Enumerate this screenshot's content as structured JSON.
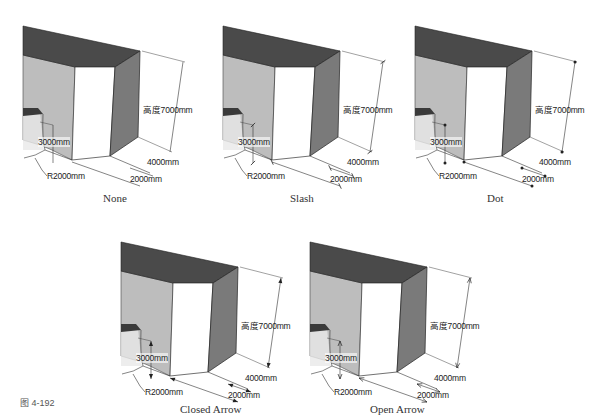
{
  "figure": {
    "label": "图 4-192"
  },
  "dimensions": {
    "height": "高度7000mm",
    "depth": "4000mm",
    "width": "2000mm",
    "opening": "3000mm",
    "radius": "R2000mm"
  },
  "colors": {
    "top_face": "#4a4a4a",
    "left_face": "#bdbdbd",
    "front_face": "#ffffff",
    "right_face": "#7a7a7a",
    "line": "#333333"
  },
  "panels": [
    {
      "caption": "None",
      "endpoint": "none"
    },
    {
      "caption": "Slash",
      "endpoint": "slash"
    },
    {
      "caption": "Dot",
      "endpoint": "dot"
    },
    {
      "caption": "Closed Arrow",
      "endpoint": "closed-arrow"
    },
    {
      "caption": "Open Arrow",
      "endpoint": "open-arrow"
    }
  ]
}
